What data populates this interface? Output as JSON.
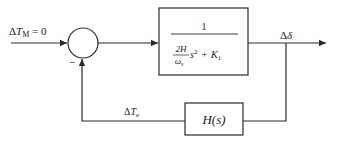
{
  "diagram": {
    "type": "control-block-diagram",
    "input": {
      "delta": "Δ",
      "symbol": "T",
      "subscript": "M",
      "value_text": " = 0"
    },
    "summing_junction": {
      "sign_feedback": "−"
    },
    "forward_block": {
      "numerator": "1",
      "den_coef_num": "2H",
      "den_coef_den": "ω",
      "den_coef_den_sub": "s",
      "den_s": "s",
      "den_s_power": "2",
      "den_plus": "+",
      "den_K": "K",
      "den_K_sub": "1"
    },
    "output": {
      "delta": "Δ",
      "symbol": "δ"
    },
    "feedback_signal": {
      "delta": "Δ",
      "symbol": "T",
      "subscript": "e"
    },
    "feedback_block": {
      "label": "H(s)"
    },
    "colors": {
      "line": "#2a2a2a",
      "background": "#ffffff"
    }
  }
}
